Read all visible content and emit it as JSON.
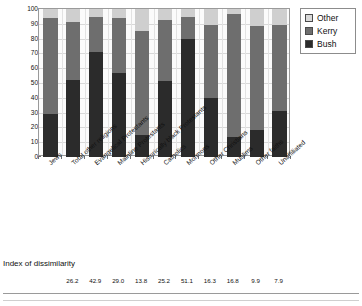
{
  "chart_data": {
    "type": "bar",
    "subtype": "stacked-100-percent",
    "title": "",
    "xlabel": "",
    "ylabel": "Percentages",
    "ylim": [
      0,
      100
    ],
    "ytick_step": 10,
    "yticks": [
      0,
      10,
      20,
      30,
      40,
      50,
      60,
      70,
      80,
      90,
      100
    ],
    "grid": true,
    "legend_position": "right-top",
    "categories": [
      "Jews",
      "Total other religions",
      "Evangelical Protestants",
      "Mainline Protestants",
      "Historically black Protestants",
      "Catholics",
      "Mormons",
      "Other Christians",
      "Muslims",
      "Other faiths",
      "Unaffiliated"
    ],
    "series": [
      {
        "name": "Bush",
        "color": "#2b2b2b",
        "values": [
          28.8,
          52.0,
          70.8,
          56.8,
          15.0,
          51.5,
          79.5,
          40.0,
          13.5,
          18.5,
          31.0
        ]
      },
      {
        "name": "Kerry",
        "color": "#6e6e6e",
        "values": [
          65.2,
          39.5,
          23.7,
          37.4,
          70.0,
          41.0,
          15.3,
          49.0,
          82.8,
          70.0,
          58.5
        ]
      },
      {
        "name": "Other",
        "color": "#cfcfcf",
        "values": [
          6.0,
          8.5,
          5.5,
          5.8,
          15.0,
          7.5,
          5.2,
          11.0,
          3.7,
          11.5,
          10.5
        ]
      }
    ],
    "cumulative_tops": {
      "bush": [
        28.8,
        52.0,
        70.8,
        56.8,
        15.0,
        51.5,
        79.5,
        40.0,
        13.5,
        18.5,
        31.0
      ],
      "kerry": [
        94.0,
        91.5,
        94.5,
        94.2,
        85.0,
        92.5,
        94.8,
        89.0,
        96.3,
        88.5,
        89.5
      ],
      "other": [
        100,
        100,
        100,
        100,
        100,
        100,
        100,
        100,
        100,
        100,
        100
      ]
    }
  },
  "legend": {
    "items": [
      {
        "label": "Other",
        "swatch": "sw-other"
      },
      {
        "label": "Kerry",
        "swatch": "sw-kerry"
      },
      {
        "label": "Bush",
        "swatch": "sw-bush"
      }
    ]
  },
  "index_block": {
    "title": "Index of dissimilarity",
    "values": [
      "",
      "26.2",
      "42.9",
      "29.0",
      "13.8",
      "25.2",
      "51.1",
      "16.3",
      "16.8",
      "9.9",
      "7.9"
    ]
  }
}
